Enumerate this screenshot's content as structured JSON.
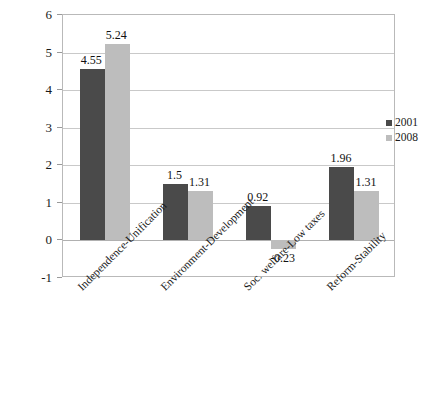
{
  "chart_data": {
    "type": "bar",
    "title": "",
    "xlabel": "",
    "ylabel": "",
    "ylim": [
      -1,
      6
    ],
    "grid": true,
    "legend_position": "right",
    "categories": [
      "Independence-Unification",
      "Environment-Development",
      "Soc. welfare-Low taxes",
      "Reform-Stability"
    ],
    "y_ticks": [
      "6",
      "5",
      "4",
      "3",
      "2",
      "1",
      "0",
      "-1"
    ],
    "y_tick_values": [
      6,
      5,
      4,
      3,
      2,
      1,
      0,
      -1
    ],
    "series": [
      {
        "name": "2001",
        "color": "#4a4a4a",
        "values": [
          4.55,
          1.5,
          0.92,
          1.96
        ],
        "labels": [
          "4.55",
          "1.5",
          "0.92",
          "1.96"
        ]
      },
      {
        "name": "2008",
        "color": "#bdbdbd",
        "values": [
          5.24,
          1.31,
          -0.23,
          1.31
        ],
        "labels": [
          "5.24",
          "1.31",
          "-0.23",
          "1.31"
        ]
      }
    ]
  },
  "legend": {
    "items": [
      {
        "label": "2001",
        "color": "#4a4a4a"
      },
      {
        "label": "2008",
        "color": "#bdbdbd"
      }
    ]
  }
}
